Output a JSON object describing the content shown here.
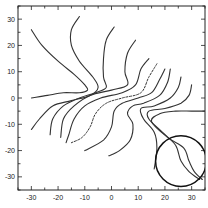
{
  "chart_data": {
    "type": "line",
    "subtype": "contour",
    "title": "",
    "xlabel": "",
    "ylabel": "",
    "xlim": [
      -35,
      35
    ],
    "ylim": [
      -35,
      35
    ],
    "grid": false,
    "legend": null,
    "x_ticks": [
      -30,
      -20,
      -10,
      0,
      10,
      20,
      30
    ],
    "y_ticks": [
      30,
      20,
      10,
      0,
      -10,
      -20,
      -30
    ],
    "x_tick_labels": [
      "-30",
      "-20",
      "-10",
      "0",
      "10",
      "20",
      "30"
    ],
    "y_tick_labels": [
      "30",
      "20",
      "10",
      "0",
      "-10",
      "-20",
      "-30"
    ],
    "series": [
      {
        "name": "contour-1",
        "style": "solid",
        "points": [
          [
            -30,
            26
          ],
          [
            -26,
            20
          ],
          [
            -20,
            14
          ],
          [
            -14,
            9
          ],
          [
            -10,
            5
          ],
          [
            -9,
            3
          ],
          [
            -12,
            2
          ],
          [
            -18,
            2
          ],
          [
            -24,
            1
          ],
          [
            -30,
            0
          ]
        ]
      },
      {
        "name": "contour-2",
        "style": "solid",
        "points": [
          [
            -12,
            31
          ],
          [
            -15,
            26
          ],
          [
            -15,
            20
          ],
          [
            -12,
            14
          ],
          [
            -7,
            8
          ],
          [
            -5,
            4
          ],
          [
            -8,
            1
          ],
          [
            -15,
            -1
          ],
          [
            -22,
            -3
          ],
          [
            -27,
            -8
          ],
          [
            -30,
            -12
          ]
        ]
      },
      {
        "name": "contour-3",
        "style": "solid",
        "points": [
          [
            1,
            27
          ],
          [
            -2,
            22
          ],
          [
            -3,
            15
          ],
          [
            -3,
            8
          ],
          [
            -2,
            4
          ],
          [
            -6,
            2
          ],
          [
            -12,
            0
          ],
          [
            -18,
            -3
          ],
          [
            -22,
            -8
          ],
          [
            -23,
            -14
          ]
        ]
      },
      {
        "name": "contour-4",
        "style": "solid",
        "points": [
          [
            9,
            22
          ],
          [
            6,
            17
          ],
          [
            5,
            10
          ],
          [
            6,
            5
          ],
          [
            0,
            3
          ],
          [
            -8,
            1
          ],
          [
            -14,
            -3
          ],
          [
            -18,
            -8
          ],
          [
            -19,
            -15
          ]
        ]
      },
      {
        "name": "contour-5",
        "style": "solid",
        "points": [
          [
            14,
            15
          ],
          [
            11,
            11
          ],
          [
            9,
            5
          ],
          [
            4,
            2
          ],
          [
            -4,
            0
          ],
          [
            -10,
            -3
          ],
          [
            -14,
            -8
          ],
          [
            -16,
            -14
          ],
          [
            -17,
            -17
          ]
        ]
      },
      {
        "name": "contour-6",
        "style": "dashed",
        "points": [
          [
            17,
            13
          ],
          [
            14,
            8
          ],
          [
            11,
            2
          ],
          [
            4,
            0
          ],
          [
            -2,
            -2
          ],
          [
            -6,
            -6
          ],
          [
            -8,
            -11
          ],
          [
            -11,
            -15
          ],
          [
            -15,
            -17
          ]
        ]
      },
      {
        "name": "contour-7",
        "style": "solid",
        "points": [
          [
            20,
            11
          ],
          [
            18,
            7
          ],
          [
            15,
            2
          ],
          [
            10,
            0
          ],
          [
            4,
            -2
          ],
          [
            1,
            -5
          ],
          [
            0,
            -11
          ],
          [
            -3,
            -16
          ],
          [
            -10,
            -20
          ]
        ]
      },
      {
        "name": "contour-8",
        "style": "solid",
        "points": [
          [
            22,
            11
          ],
          [
            21,
            6
          ],
          [
            18,
            1
          ],
          [
            12,
            -2
          ],
          [
            8,
            -3
          ],
          [
            6,
            -6
          ],
          [
            8,
            -10
          ],
          [
            7,
            -16
          ],
          [
            3,
            -20
          ],
          [
            -1,
            -22
          ]
        ]
      },
      {
        "name": "contour-9",
        "style": "solid",
        "points": [
          [
            26,
            8
          ],
          [
            25,
            4
          ],
          [
            22,
            0
          ],
          [
            16,
            -3
          ],
          [
            11,
            -4
          ],
          [
            12,
            -8
          ],
          [
            16,
            -13
          ],
          [
            17,
            -19
          ],
          [
            16,
            -27
          ]
        ]
      },
      {
        "name": "contour-10",
        "style": "solid",
        "points": [
          [
            30,
            5
          ],
          [
            29,
            1
          ],
          [
            26,
            -2
          ],
          [
            20,
            -4
          ],
          [
            14,
            -5
          ],
          [
            14,
            -8
          ],
          [
            19,
            -13
          ],
          [
            24,
            -18
          ],
          [
            26,
            -24
          ],
          [
            29,
            -28
          ],
          [
            33,
            -31
          ]
        ]
      },
      {
        "name": "contour-11",
        "style": "solid",
        "points": [
          [
            35,
            -5
          ],
          [
            30,
            -5
          ],
          [
            24,
            -5
          ],
          [
            18,
            -6
          ],
          [
            15,
            -9
          ],
          [
            21,
            -15
          ],
          [
            27,
            -19
          ],
          [
            29,
            -24
          ],
          [
            31,
            -28
          ],
          [
            34,
            -31
          ]
        ]
      }
    ],
    "annotations": [
      {
        "type": "circle",
        "center": [
          26,
          -24
        ],
        "radius": 9.5
      }
    ]
  }
}
